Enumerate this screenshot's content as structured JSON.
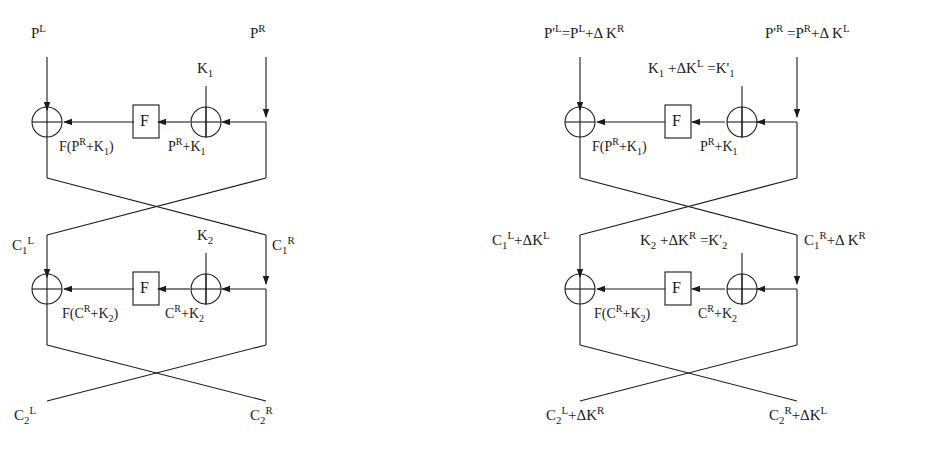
{
  "figure": {
    "type": "diagram",
    "function_box_label": "F",
    "line_color": "#1b1b1b",
    "background": "#ffffff"
  },
  "diagrams": [
    {
      "id": "left",
      "name": "original-feistel-network",
      "inputs": {
        "left": "P<sup>L</sup>",
        "right": "P<sup>R</sup>"
      },
      "round1": {
        "key": "K<sub>1</sub>",
        "f_output": "F(P<sup>R</sup>+K<sub>1</sub>)",
        "xor_output": "P<sup>R</sup>+K<sub>1</sub>",
        "box": "F"
      },
      "mid": {
        "left": "C<sub>1</sub><sup>L</sup>",
        "right": "C<sub>1</sub><sup>R</sup>"
      },
      "round2": {
        "key": "K<sub>2</sub>",
        "f_output": "F(C<sup>R</sup>+K<sub>2</sub>)",
        "xor_output": "C<sup>R</sup>+K<sub>2</sub>",
        "box": "F"
      },
      "outputs": {
        "left": "C<sub>2</sub><sup>L</sup>",
        "right": "C<sub>2</sub><sup>R</sup>"
      }
    },
    {
      "id": "right",
      "name": "related-key-feistel-network",
      "inputs": {
        "left": "P'<sup>L</sup>=P<sup>L</sup>+Δ K<sup>R</sup>",
        "right": "P'<sup>R</sup> =P<sup>R</sup>+Δ K<sup>L</sup>"
      },
      "round1": {
        "key": "K<sub>1</sub> +ΔK<sup>L</sup> =K'<sub>1</sub>",
        "f_output": "F(P<sup>R</sup>+K<sub>1</sub>)",
        "xor_output": "P<sup>R</sup>+K<sub>1</sub>",
        "box": "F"
      },
      "mid": {
        "left": "C<sub>1</sub><sup>L</sup>+ΔK<sup>L</sup>",
        "right": "C<sub>1</sub><sup>R</sup>+Δ K<sup>R</sup>"
      },
      "round2": {
        "key": "K<sub>2</sub> +ΔK<sup>R</sup> =K'<sub>2</sub>",
        "f_output": "F(C<sup>R</sup>+K<sub>2</sub>)",
        "xor_output": "C<sup>R</sup>+K<sub>2</sub>",
        "box": "F"
      },
      "outputs": {
        "left": "C<sub>2</sub><sup>L</sup>+ΔK<sup>R</sup>",
        "right": "C<sub>2</sub><sup>R</sup>+ΔK<sup>L</sup>"
      }
    }
  ]
}
